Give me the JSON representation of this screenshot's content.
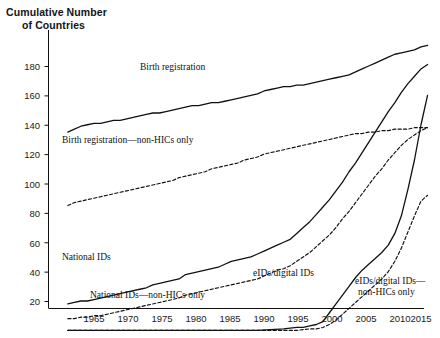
{
  "chart_data": {
    "type": "line",
    "title": "Cumulative Number of Countries",
    "title_line1": "Cumulative Number",
    "title_line2": "of Countries",
    "xlabel": "",
    "ylabel": "Cumulative Number of Countries",
    "xlim": [
      1961,
      2016
    ],
    "ylim": [
      0,
      200
    ],
    "grid": false,
    "legend_position": "inline-annotations",
    "xticks": [
      1965,
      1970,
      1975,
      1980,
      1985,
      1990,
      1995,
      2000,
      2005,
      2010,
      2015
    ],
    "yticks": [
      20,
      40,
      60,
      80,
      100,
      120,
      140,
      160,
      180
    ],
    "series": [
      {
        "name": "Birth registration",
        "style": "solid",
        "color": "#111111",
        "label_x": 1978,
        "label_y": 172,
        "x": [
          1961,
          1962,
          1963,
          1964,
          1965,
          1966,
          1967,
          1968,
          1969,
          1970,
          1971,
          1972,
          1973,
          1974,
          1975,
          1976,
          1977,
          1978,
          1979,
          1980,
          1981,
          1982,
          1983,
          1984,
          1985,
          1986,
          1987,
          1988,
          1989,
          1990,
          1991,
          1992,
          1993,
          1994,
          1995,
          1996,
          1997,
          1998,
          1999,
          2000,
          2001,
          2002,
          2003,
          2004,
          2005,
          2006,
          2007,
          2008,
          2009,
          2010,
          2011,
          2012,
          2013,
          2014,
          2015,
          2016
        ],
        "values": [
          135,
          137,
          139,
          140,
          141,
          141,
          142,
          143,
          143,
          144,
          145,
          146,
          147,
          148,
          148,
          149,
          150,
          151,
          152,
          153,
          153,
          154,
          155,
          155,
          156,
          157,
          158,
          159,
          160,
          161,
          163,
          164,
          165,
          166,
          166,
          167,
          167,
          168,
          169,
          170,
          171,
          172,
          173,
          174,
          176,
          178,
          180,
          182,
          184,
          186,
          188,
          189,
          190,
          191,
          193,
          194
        ]
      },
      {
        "name": "Birth registration—non-HICs only",
        "style": "dashed",
        "color": "#111111",
        "label_x": 1971,
        "label_y": 124,
        "x": [
          1961,
          1962,
          1963,
          1964,
          1965,
          1966,
          1967,
          1968,
          1969,
          1970,
          1971,
          1972,
          1973,
          1974,
          1975,
          1976,
          1977,
          1978,
          1979,
          1980,
          1981,
          1982,
          1983,
          1984,
          1985,
          1986,
          1987,
          1988,
          1989,
          1990,
          1991,
          1992,
          1993,
          1994,
          1995,
          1996,
          1997,
          1998,
          1999,
          2000,
          2001,
          2002,
          2003,
          2004,
          2005,
          2006,
          2007,
          2008,
          2009,
          2010,
          2011,
          2012,
          2013,
          2014,
          2015,
          2016
        ],
        "values": [
          85,
          87,
          88,
          89,
          90,
          91,
          92,
          93,
          94,
          95,
          96,
          97,
          98,
          99,
          100,
          101,
          102,
          104,
          105,
          106,
          107,
          108,
          110,
          111,
          112,
          113,
          114,
          116,
          117,
          118,
          120,
          121,
          122,
          123,
          124,
          125,
          126,
          127,
          128,
          129,
          130,
          131,
          132,
          133,
          134,
          134,
          135,
          135,
          136,
          136,
          137,
          137,
          137,
          138,
          138,
          138
        ]
      },
      {
        "name": "National IDs",
        "style": "solid",
        "color": "#111111",
        "label_x": 1966,
        "label_y": 47,
        "x": [
          1961,
          1962,
          1963,
          1964,
          1965,
          1966,
          1967,
          1968,
          1969,
          1970,
          1971,
          1972,
          1973,
          1974,
          1975,
          1976,
          1977,
          1978,
          1979,
          1980,
          1981,
          1982,
          1983,
          1984,
          1985,
          1986,
          1987,
          1988,
          1989,
          1990,
          1991,
          1992,
          1993,
          1994,
          1995,
          1996,
          1997,
          1998,
          1999,
          2000,
          2001,
          2002,
          2003,
          2004,
          2005,
          2006,
          2007,
          2008,
          2009,
          2010,
          2011,
          2012,
          2013,
          2014,
          2015,
          2016
        ],
        "values": [
          18,
          19,
          20,
          20,
          21,
          22,
          23,
          24,
          25,
          26,
          27,
          28,
          29,
          31,
          32,
          33,
          34,
          35,
          38,
          39,
          40,
          41,
          42,
          43,
          45,
          47,
          48,
          49,
          50,
          52,
          54,
          56,
          58,
          60,
          62,
          66,
          70,
          74,
          79,
          84,
          89,
          95,
          101,
          108,
          114,
          121,
          128,
          135,
          142,
          149,
          155,
          162,
          168,
          173,
          178,
          181
        ]
      },
      {
        "name": "National IDs—non-HICs only",
        "style": "dashed",
        "color": "#111111",
        "label_x": 1974,
        "label_y": 20,
        "x": [
          1961,
          1962,
          1963,
          1964,
          1965,
          1966,
          1967,
          1968,
          1969,
          1970,
          1971,
          1972,
          1973,
          1974,
          1975,
          1976,
          1977,
          1978,
          1979,
          1980,
          1981,
          1982,
          1983,
          1984,
          1985,
          1986,
          1987,
          1988,
          1989,
          1990,
          1991,
          1992,
          1993,
          1994,
          1995,
          1996,
          1997,
          1998,
          1999,
          2000,
          2001,
          2002,
          2003,
          2004,
          2005,
          2006,
          2007,
          2008,
          2009,
          2010,
          2011,
          2012,
          2013,
          2014,
          2015,
          2016
        ],
        "values": [
          8,
          8,
          9,
          9,
          10,
          10,
          11,
          12,
          13,
          14,
          15,
          16,
          17,
          18,
          19,
          20,
          21,
          22,
          24,
          25,
          26,
          27,
          28,
          29,
          30,
          31,
          32,
          33,
          34,
          35,
          37,
          39,
          41,
          42,
          44,
          47,
          50,
          53,
          57,
          61,
          65,
          70,
          76,
          81,
          87,
          93,
          99,
          105,
          110,
          116,
          121,
          126,
          130,
          133,
          136,
          138
        ]
      },
      {
        "name": "eIDs/digital IDs",
        "style": "solid",
        "color": "#111111",
        "label_x": 1999,
        "label_y": 28,
        "x": [
          1961,
          1985,
          1990,
          1994,
          1996,
          1997,
          1998,
          1999,
          2000,
          2001,
          2002,
          2003,
          2004,
          2005,
          2006,
          2007,
          2008,
          2009,
          2010,
          2011,
          2012,
          2013,
          2014,
          2015,
          2016
        ],
        "values": [
          0,
          0,
          0,
          1,
          2,
          2,
          3,
          4,
          6,
          12,
          18,
          24,
          30,
          36,
          41,
          45,
          49,
          53,
          58,
          66,
          78,
          96,
          116,
          140,
          160
        ]
      },
      {
        "name": "eIDs/digital IDs—non-HICs only",
        "style": "dashed",
        "color": "#111111",
        "label_line1": "eIDs/digital IDs—",
        "label_line2": "non-HICs only",
        "label_x": 2007,
        "label_y": 26,
        "x": [
          1961,
          1990,
          1996,
          1998,
          1999,
          2000,
          2001,
          2002,
          2003,
          2004,
          2005,
          2006,
          2007,
          2008,
          2009,
          2010,
          2011,
          2012,
          2013,
          2014,
          2015,
          2016
        ],
        "values": [
          0,
          0,
          0,
          1,
          1,
          2,
          4,
          7,
          11,
          15,
          19,
          23,
          27,
          31,
          35,
          40,
          47,
          56,
          67,
          78,
          88,
          92
        ]
      }
    ]
  },
  "labels": {
    "birth_registration": "Birth registration",
    "birth_registration_nonhic": "Birth registration—non-HICs only",
    "national_ids": "National IDs",
    "national_ids_nonhic": "National IDs—non-HICs only",
    "eids": "eIDs/digital IDs",
    "eids_nonhic_line1": "eIDs/digital IDs—",
    "eids_nonhic_line2": "non-HICs only"
  },
  "yticks": {
    "t180": "180",
    "t160": "160",
    "t140": "140",
    "t120": "120",
    "t100": "100",
    "t80": "80",
    "t60": "60",
    "t40": "40",
    "t20": "20"
  },
  "xticks": {
    "t1965": "1965",
    "t1970": "1970",
    "t1975": "1975",
    "t1980": "1980",
    "t1985": "1985",
    "t1990": "1990",
    "t1995": "1995",
    "t2000": "2000",
    "t2005": "2005",
    "t2010": "2010",
    "t2015": "2015"
  }
}
